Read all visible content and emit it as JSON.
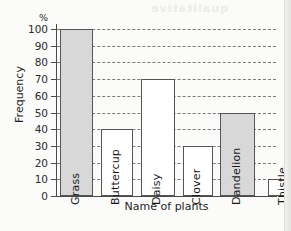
{
  "bleed_text": "qualitative",
  "chart_data": {
    "type": "bar",
    "title": "",
    "xlabel": "Name of plants",
    "ylabel": "Frequency",
    "yunit": "%",
    "ylim": [
      0,
      100
    ],
    "ytick_step": 10,
    "yticks": [
      "0",
      "10",
      "20",
      "30",
      "40",
      "50",
      "60",
      "70",
      "80",
      "90",
      "100"
    ],
    "grid": "horizontal-dashed",
    "legend": "none",
    "categories": [
      "Grass",
      "Buttercup",
      "Daisy",
      "Clover",
      "Dandelion",
      "Thistle"
    ],
    "values": [
      100,
      40,
      70,
      30,
      50,
      10
    ],
    "bar_fills": [
      "#d8d8d8",
      "#ffffff",
      "#ffffff",
      "#ffffff",
      "#d8d8d8",
      "#ffffff"
    ],
    "bar_edge_color": "#555555",
    "axis_color": "#4a4a4a",
    "grid_color": "#7a7a7a"
  }
}
